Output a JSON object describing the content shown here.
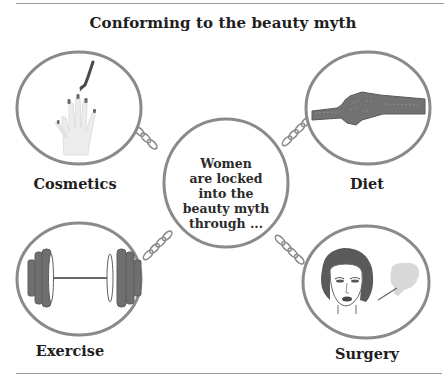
{
  "title": "Conforming to the beauty myth",
  "center": {
    "lines": [
      "Women",
      "are locked",
      "into the",
      "beauty myth",
      "through ..."
    ]
  },
  "nodes": [
    {
      "label": "Cosmetics",
      "icon": "nail-polish-hand-icon",
      "position": "top-left"
    },
    {
      "label": "Diet",
      "icon": "tape-measure-icon",
      "position": "top-right"
    },
    {
      "label": "Exercise",
      "icon": "barbell-icon",
      "position": "bottom-left"
    },
    {
      "label": "Surgery",
      "icon": "face-surgery-icon",
      "position": "bottom-right"
    }
  ],
  "connectors": "chain",
  "colors": {
    "outline": "#8a8a8a",
    "dark_fill": "#6a6a6a",
    "light_fill": "#e8e8e8",
    "text": "#1e1e1e"
  }
}
